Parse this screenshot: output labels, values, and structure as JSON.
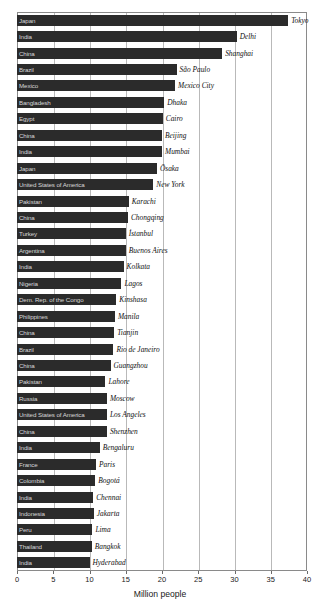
{
  "chart_data": {
    "type": "bar",
    "orientation": "horizontal",
    "title": "",
    "xlabel": "Million people",
    "ylabel": "",
    "xlim": [
      0,
      40
    ],
    "xticks": [
      0,
      5,
      10,
      15,
      20,
      25,
      30,
      35,
      40
    ],
    "grid": true,
    "legend": "none",
    "bar_color": "#2b2b2b",
    "in_bar_text_color": "#d8d8d8",
    "categories": [
      "Tokyo",
      "Delhi",
      "Shanghai",
      "São Paulo",
      "Mexico City",
      "Dhaka",
      "Cairo",
      "Beijing",
      "Mumbai",
      "Ōsaka",
      "New York",
      "Karachi",
      "Chongqing",
      "İstanbul",
      "Buenos Aires",
      "Kolkata",
      "Lagos",
      "Kinshasa",
      "Manila",
      "Tianjin",
      "Rio de Janeiro",
      "Guangzhou",
      "Lahore",
      "Moscow",
      "Los Angeles",
      "Shenzhen",
      "Bengaluru",
      "Paris",
      "Bogotá",
      "Chennai",
      "Jakarta",
      "Lima",
      "Bangkok",
      "Hyderabad"
    ],
    "countries": [
      "Japan",
      "India",
      "China",
      "Brazil",
      "Mexico",
      "Bangladesh",
      "Egypt",
      "China",
      "India",
      "Japan",
      "United States of America",
      "Pakistan",
      "China",
      "Turkey",
      "Argentina",
      "India",
      "Nigeria",
      "Dem. Rep. of the Congo",
      "Philippines",
      "China",
      "Brazil",
      "China",
      "Pakistan",
      "Russia",
      "United States of America",
      "China",
      "India",
      "France",
      "Colombia",
      "India",
      "Indonesia",
      "Peru",
      "Thailand",
      "India"
    ],
    "values": [
      37.4,
      30.3,
      28.3,
      22.0,
      21.8,
      20.3,
      20.1,
      20.0,
      20.0,
      19.3,
      18.8,
      15.4,
      15.3,
      15.0,
      15.0,
      14.7,
      14.4,
      13.7,
      13.5,
      13.4,
      13.3,
      12.9,
      12.2,
      12.4,
      12.4,
      12.4,
      11.4,
      10.9,
      10.8,
      10.5,
      10.6,
      10.4,
      10.3,
      10.0
    ],
    "units": "Million people"
  },
  "axis": {
    "tick_labels": [
      "0",
      "5",
      "10",
      "15",
      "20",
      "25",
      "30",
      "35",
      "40"
    ],
    "title": "Million people"
  }
}
